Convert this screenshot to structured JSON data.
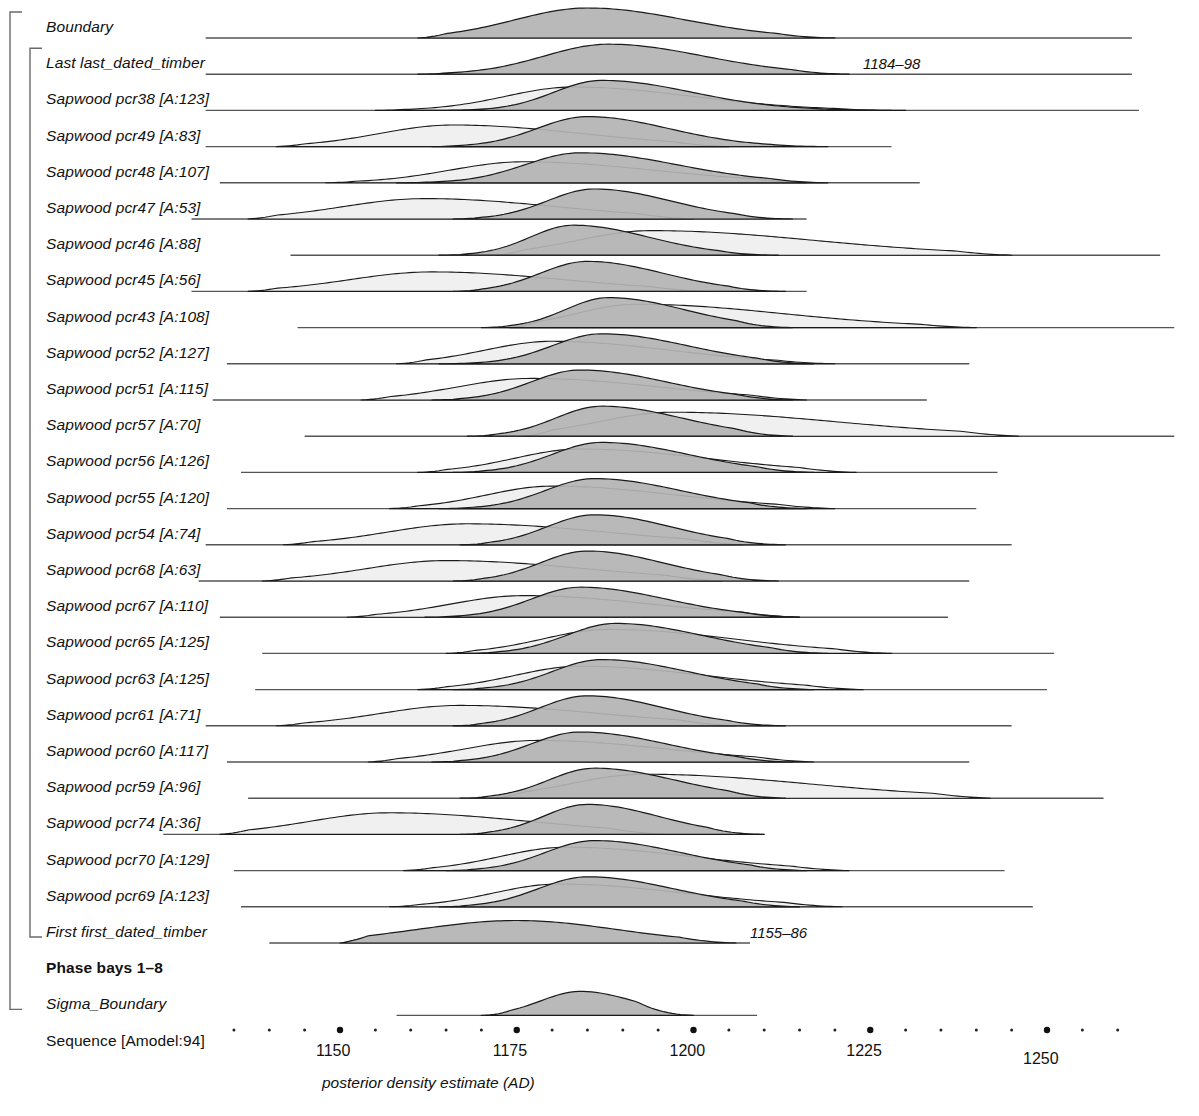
{
  "chart_data": {
    "type": "area",
    "title": "",
    "xlabel": "posterior density estimate (AD)",
    "ylabel": "",
    "xlim": [
      1132,
      1264
    ],
    "grid": false,
    "legend": null,
    "axis": {
      "major_ticks": [
        1150,
        1175,
        1200,
        1225,
        1250
      ],
      "major_tick_labels": [
        "1150",
        "1175",
        "1200",
        "1225",
        "1250"
      ],
      "minor_tick_step": 5,
      "minor_ticks": [
        1135,
        1140,
        1145,
        1155,
        1160,
        1165,
        1170,
        1180,
        1185,
        1190,
        1195,
        1205,
        1210,
        1215,
        1220,
        1230,
        1235,
        1240,
        1245,
        1255,
        1260
      ],
      "tick_style": "dots"
    },
    "colors": {
      "posterior_fill": "#b3b3b3",
      "prior_fill": "#f0f0f0",
      "outline": "#1a1a1a",
      "baseline": "#555555",
      "text": "#111111"
    },
    "brackets": [
      {
        "name": "sequence-bracket",
        "from_row": 0,
        "to_row": 27,
        "depth": 0
      },
      {
        "name": "phase-bracket",
        "from_row": 1,
        "to_row": 25,
        "depth": 1
      }
    ],
    "rows": [
      {
        "label": "Boundary",
        "style": "italic",
        "kind": "boundary",
        "posterior": {
          "start": 1161,
          "peak": 1185,
          "end": 1220,
          "spread": 11,
          "skew": 0.15,
          "height": 1.0
        },
        "prior": null,
        "range": null
      },
      {
        "label": "Last last_dated_timber",
        "style": "italic",
        "kind": "boundary",
        "posterior": {
          "start": 1161,
          "peak": 1188,
          "end": 1222,
          "spread": 10,
          "skew": 0.2,
          "height": 1.0
        },
        "prior": null,
        "range": "1184–98"
      },
      {
        "label": "Sapwood pcr38 [A:123]",
        "style": "italic",
        "kind": "sapwood",
        "posterior": {
          "start": 1158,
          "peak": 1187,
          "end": 1230,
          "spread": 8,
          "skew": 0.35,
          "height": 1.0
        },
        "prior": {
          "start": 1155,
          "peak": 1183,
          "end": 1228,
          "spread": 11,
          "skew": 0.3,
          "height": 0.78
        },
        "baseline_end": 1263,
        "range": null
      },
      {
        "label": "Sapwood pcr49 [A:83]",
        "style": "italic",
        "kind": "sapwood",
        "posterior": {
          "start": 1163,
          "peak": 1185,
          "end": 1219,
          "spread": 8,
          "skew": 0.25,
          "height": 1.0
        },
        "prior": {
          "start": 1141,
          "peak": 1166,
          "end": 1205,
          "spread": 12,
          "skew": 0.3,
          "height": 0.72
        },
        "baseline_start": 1131,
        "baseline_end": 1228,
        "range": null
      },
      {
        "label": "Sapwood pcr48 [A:107]",
        "style": "italic",
        "kind": "sapwood",
        "posterior": {
          "start": 1158,
          "peak": 1184,
          "end": 1219,
          "spread": 9,
          "skew": 0.3,
          "height": 1.0
        },
        "prior": {
          "start": 1148,
          "peak": 1176,
          "end": 1216,
          "spread": 12,
          "skew": 0.3,
          "height": 0.7
        },
        "baseline_start": 1133,
        "baseline_end": 1232,
        "range": null
      },
      {
        "label": "Sapwood pcr47 [A:53]",
        "style": "italic",
        "kind": "sapwood",
        "posterior": {
          "start": 1166,
          "peak": 1186,
          "end": 1214,
          "spread": 7.5,
          "skew": 0.25,
          "height": 1.0
        },
        "prior": {
          "start": 1137,
          "peak": 1162,
          "end": 1200,
          "spread": 13,
          "skew": 0.25,
          "height": 0.68
        },
        "baseline_start": 1129,
        "baseline_end": 1216,
        "range": null
      },
      {
        "label": "Sapwood pcr46 [A:88]",
        "style": "italic",
        "kind": "sapwood",
        "posterior": {
          "start": 1164,
          "peak": 1183,
          "end": 1212,
          "spread": 7,
          "skew": 0.3,
          "height": 1.0
        },
        "prior": {
          "start": 1172,
          "peak": 1194,
          "end": 1245,
          "spread": 13,
          "skew": 0.45,
          "height": 0.82
        },
        "baseline_start": 1143,
        "baseline_end": 1266,
        "range": null
      },
      {
        "label": "Sapwood pcr45 [A:56]",
        "style": "italic",
        "kind": "sapwood",
        "posterior": {
          "start": 1166,
          "peak": 1185,
          "end": 1213,
          "spread": 7.5,
          "skew": 0.25,
          "height": 1.0
        },
        "prior": {
          "start": 1137,
          "peak": 1163,
          "end": 1202,
          "spread": 13,
          "skew": 0.25,
          "height": 0.65
        },
        "baseline_start": 1129,
        "baseline_end": 1216,
        "range": null
      },
      {
        "label": "Sapwood pcr43 [A:108]",
        "style": "italic",
        "kind": "sapwood",
        "posterior": {
          "start": 1170,
          "peak": 1188,
          "end": 1214,
          "spread": 7,
          "skew": 0.3,
          "height": 1.0
        },
        "prior": {
          "start": 1174,
          "peak": 1192,
          "end": 1240,
          "spread": 11,
          "skew": 0.5,
          "height": 0.78
        },
        "baseline_start": 1144,
        "baseline_end": 1268,
        "range": null
      },
      {
        "label": "Sapwood pcr52 [A:127]",
        "style": "italic",
        "kind": "sapwood",
        "posterior": {
          "start": 1164,
          "peak": 1187,
          "end": 1217,
          "spread": 8,
          "skew": 0.3,
          "height": 1.0
        },
        "prior": {
          "start": 1158,
          "peak": 1180,
          "end": 1220,
          "spread": 11,
          "skew": 0.3,
          "height": 0.75
        },
        "baseline_start": 1134,
        "baseline_end": 1239,
        "range": null
      },
      {
        "label": "Sapwood pcr51 [A:115]",
        "style": "italic",
        "kind": "sapwood",
        "posterior": {
          "start": 1163,
          "peak": 1184,
          "end": 1214,
          "spread": 8,
          "skew": 0.3,
          "height": 1.0
        },
        "prior": {
          "start": 1153,
          "peak": 1177,
          "end": 1216,
          "spread": 12,
          "skew": 0.3,
          "height": 0.72
        },
        "baseline_start": 1132,
        "baseline_end": 1233,
        "range": null
      },
      {
        "label": "Sapwood pcr57 [A:70]",
        "style": "italic",
        "kind": "sapwood",
        "posterior": {
          "start": 1168,
          "peak": 1187,
          "end": 1214,
          "spread": 7.5,
          "skew": 0.3,
          "height": 1.0
        },
        "prior": {
          "start": 1176,
          "peak": 1197,
          "end": 1246,
          "spread": 13,
          "skew": 0.45,
          "height": 0.8
        },
        "baseline_start": 1145,
        "baseline_end": 1268,
        "range": null
      },
      {
        "label": "Sapwood pcr56 [A:126]",
        "style": "italic",
        "kind": "sapwood",
        "posterior": {
          "start": 1166,
          "peak": 1187,
          "end": 1217,
          "spread": 8,
          "skew": 0.3,
          "height": 1.0
        },
        "prior": {
          "start": 1161,
          "peak": 1184,
          "end": 1223,
          "spread": 11,
          "skew": 0.35,
          "height": 0.78
        },
        "baseline_start": 1136,
        "baseline_end": 1243,
        "range": null
      },
      {
        "label": "Sapwood pcr55 [A:120]",
        "style": "italic",
        "kind": "sapwood",
        "posterior": {
          "start": 1164,
          "peak": 1186,
          "end": 1216,
          "spread": 8,
          "skew": 0.3,
          "height": 1.0
        },
        "prior": {
          "start": 1157,
          "peak": 1180,
          "end": 1220,
          "spread": 11,
          "skew": 0.35,
          "height": 0.75
        },
        "baseline_start": 1134,
        "baseline_end": 1240,
        "range": null
      },
      {
        "label": "Sapwood pcr54 [A:74]",
        "style": "italic",
        "kind": "sapwood",
        "posterior": {
          "start": 1167,
          "peak": 1186,
          "end": 1213,
          "spread": 7.5,
          "skew": 0.25,
          "height": 1.0
        },
        "prior": {
          "start": 1142,
          "peak": 1168,
          "end": 1207,
          "spread": 13,
          "skew": 0.3,
          "height": 0.7
        },
        "baseline_start": 1131,
        "baseline_end": 1245,
        "range": null
      },
      {
        "label": "Sapwood pcr68 [A:63]",
        "style": "italic",
        "kind": "sapwood",
        "posterior": {
          "start": 1166,
          "peak": 1185,
          "end": 1212,
          "spread": 7.5,
          "skew": 0.25,
          "height": 1.0
        },
        "prior": {
          "start": 1139,
          "peak": 1165,
          "end": 1204,
          "spread": 13,
          "skew": 0.3,
          "height": 0.68
        },
        "baseline_start": 1130,
        "baseline_end": 1239,
        "range": null
      },
      {
        "label": "Sapwood pcr67 [A:110]",
        "style": "italic",
        "kind": "sapwood",
        "posterior": {
          "start": 1162,
          "peak": 1184,
          "end": 1215,
          "spread": 8,
          "skew": 0.3,
          "height": 1.0
        },
        "prior": {
          "start": 1151,
          "peak": 1176,
          "end": 1215,
          "spread": 12,
          "skew": 0.3,
          "height": 0.72
        },
        "baseline_start": 1133,
        "baseline_end": 1236,
        "range": null
      },
      {
        "label": "Sapwood pcr65 [A:125]",
        "style": "italic",
        "kind": "sapwood",
        "posterior": {
          "start": 1168,
          "peak": 1189,
          "end": 1219,
          "spread": 8,
          "skew": 0.3,
          "height": 1.0
        },
        "prior": {
          "start": 1165,
          "peak": 1188,
          "end": 1228,
          "spread": 11,
          "skew": 0.35,
          "height": 0.8
        },
        "baseline_start": 1139,
        "baseline_end": 1251,
        "range": null
      },
      {
        "label": "Sapwood pcr63 [A:125]",
        "style": "italic",
        "kind": "sapwood",
        "posterior": {
          "start": 1166,
          "peak": 1187,
          "end": 1217,
          "spread": 8,
          "skew": 0.3,
          "height": 1.0
        },
        "prior": {
          "start": 1161,
          "peak": 1184,
          "end": 1224,
          "spread": 11,
          "skew": 0.35,
          "height": 0.78
        },
        "baseline_start": 1138,
        "baseline_end": 1250,
        "range": null
      },
      {
        "label": "Sapwood pcr61 [A:71]",
        "style": "italic",
        "kind": "sapwood",
        "posterior": {
          "start": 1166,
          "peak": 1185,
          "end": 1213,
          "spread": 7.5,
          "skew": 0.25,
          "height": 1.0
        },
        "prior": {
          "start": 1141,
          "peak": 1167,
          "end": 1206,
          "spread": 13,
          "skew": 0.3,
          "height": 0.68
        },
        "baseline_start": 1131,
        "baseline_end": 1245,
        "range": null
      },
      {
        "label": "Sapwood pcr60 [A:117]",
        "style": "italic",
        "kind": "sapwood",
        "posterior": {
          "start": 1163,
          "peak": 1184,
          "end": 1214,
          "spread": 8,
          "skew": 0.3,
          "height": 1.0
        },
        "prior": {
          "start": 1154,
          "peak": 1178,
          "end": 1217,
          "spread": 12,
          "skew": 0.3,
          "height": 0.72
        },
        "baseline_start": 1134,
        "baseline_end": 1239,
        "range": null
      },
      {
        "label": "Sapwood pcr59 [A:96]",
        "style": "italic",
        "kind": "sapwood",
        "posterior": {
          "start": 1167,
          "peak": 1186,
          "end": 1213,
          "spread": 7.5,
          "skew": 0.3,
          "height": 1.0
        },
        "prior": {
          "start": 1172,
          "peak": 1193,
          "end": 1242,
          "spread": 13,
          "skew": 0.45,
          "height": 0.8
        },
        "baseline_start": 1137,
        "baseline_end": 1258,
        "range": null
      },
      {
        "label": "Sapwood pcr74 [A:36]",
        "style": "italic",
        "kind": "sapwood",
        "posterior": {
          "start": 1167,
          "peak": 1185,
          "end": 1210,
          "spread": 7,
          "skew": 0.25,
          "height": 1.0
        },
        "prior": {
          "start": 1133,
          "peak": 1157,
          "end": 1196,
          "spread": 13,
          "skew": 0.3,
          "height": 0.72
        },
        "baseline_start": 1125,
        "baseline_end": 1210,
        "range": null
      },
      {
        "label": "Sapwood pcr70 [A:129]",
        "style": "italic",
        "kind": "sapwood",
        "posterior": {
          "start": 1165,
          "peak": 1186,
          "end": 1216,
          "spread": 8,
          "skew": 0.3,
          "height": 1.0
        },
        "prior": {
          "start": 1159,
          "peak": 1182,
          "end": 1222,
          "spread": 11,
          "skew": 0.35,
          "height": 0.78
        },
        "baseline_start": 1135,
        "baseline_end": 1244,
        "range": null
      },
      {
        "label": "Sapwood pcr69 [A:123]",
        "style": "italic",
        "kind": "sapwood",
        "posterior": {
          "start": 1164,
          "peak": 1185,
          "end": 1215,
          "spread": 8,
          "skew": 0.3,
          "height": 1.0
        },
        "prior": {
          "start": 1157,
          "peak": 1181,
          "end": 1221,
          "spread": 11,
          "skew": 0.35,
          "height": 0.76
        },
        "baseline_start": 1136,
        "baseline_end": 1248,
        "range": null
      },
      {
        "label": "First first_dated_timber",
        "style": "italic",
        "kind": "boundary",
        "posterior": {
          "start": 1150,
          "peak": 1175,
          "end": 1206,
          "spread": 14,
          "skew": 0.0,
          "height": 0.75
        },
        "prior": null,
        "baseline_start": 1140,
        "baseline_end": 1208,
        "range": "1155–86"
      },
      {
        "label": "Phase bays 1–8",
        "style": "bold",
        "kind": "group",
        "posterior": null,
        "prior": null,
        "range": null
      },
      {
        "label": "Sigma_Boundary",
        "style": "italic",
        "kind": "boundary",
        "posterior": {
          "start": 1170,
          "peak": 1184,
          "end": 1200,
          "spread": 6,
          "skew": 0.15,
          "height": 0.8
        },
        "prior": null,
        "baseline_start": 1158,
        "baseline_end": 1209,
        "range": null
      },
      {
        "label": "Sequence [Amodel:94]",
        "style": "plain",
        "kind": "group",
        "posterior": null,
        "prior": null,
        "range": null
      }
    ]
  },
  "layout": {
    "row_start_y": 38,
    "row_step": 36.2,
    "label_x": 46,
    "label_indent_group": 46,
    "default_baseline_start": 1131,
    "default_baseline_end": 1262,
    "axis_y": 1030,
    "tick_label_y": 1042,
    "caption_y": 1074,
    "caption_x": 322,
    "bracket_x": [
      10,
      30
    ],
    "plot_left_px": 340,
    "plot_px_per_year": 7.07,
    "plot_left_year": 1150
  }
}
